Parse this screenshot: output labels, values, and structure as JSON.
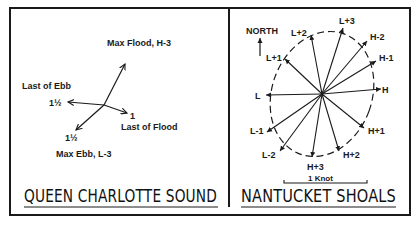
{
  "panels": [
    {
      "title": "QUEEN CHARLOTTE SOUND",
      "vectors": [
        {
          "name": "Max Flood, H-3",
          "label": "Max Flood, H-3",
          "speed_label": ""
        },
        {
          "name": "Last of Ebb",
          "label": "Last of Ebb",
          "speed_label": "1½"
        },
        {
          "name": "Last of Flood",
          "label": "Last of Flood",
          "speed_label": "1"
        },
        {
          "name": "Max Ebb, L-3",
          "label": "Max Ebb, L-3",
          "speed_label": "1½"
        }
      ]
    },
    {
      "title": "NANTUCKET SHOALS",
      "north_label": "NORTH",
      "scale_label": "1 Knot",
      "vectors": [
        {
          "label": "L+3"
        },
        {
          "label": "H-2"
        },
        {
          "label": "H-1"
        },
        {
          "label": "H"
        },
        {
          "label": "H+1"
        },
        {
          "label": "H+2"
        },
        {
          "label": "H+3"
        },
        {
          "label": "L-2"
        },
        {
          "label": "L-1"
        },
        {
          "label": "L"
        },
        {
          "label": "L+1"
        },
        {
          "label": "L+2"
        }
      ]
    }
  ],
  "colors": {
    "ink": "#1a1a1a",
    "background": "#ffffff"
  }
}
